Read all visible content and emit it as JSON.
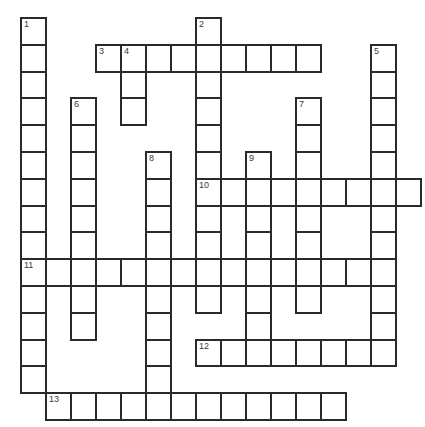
{
  "puzzle": {
    "title": "Crossword Grid",
    "grid": {
      "columns": 16,
      "rows": 15,
      "cell_width": 25,
      "cell_height": 26.8,
      "origin_x": 20,
      "origin_y": 17,
      "border_color": "#2a2a2a",
      "cell_fill": "#ffffff",
      "number_color": "#3a3a3a",
      "background": "#ffffff"
    },
    "entries": [
      {
        "number": "1",
        "direction": "down",
        "row": 0,
        "col": 0,
        "length": 14
      },
      {
        "number": "2",
        "direction": "down",
        "row": 0,
        "col": 7,
        "length": 11
      },
      {
        "number": "3",
        "direction": "across",
        "row": 1,
        "col": 3,
        "length": 9
      },
      {
        "number": "4",
        "direction": "down",
        "row": 1,
        "col": 4,
        "length": 3
      },
      {
        "number": "5",
        "direction": "down",
        "row": 1,
        "col": 14,
        "length": 12
      },
      {
        "number": "6",
        "direction": "down",
        "row": 3,
        "col": 2,
        "length": 9
      },
      {
        "number": "7",
        "direction": "down",
        "row": 3,
        "col": 11,
        "length": 8
      },
      {
        "number": "8",
        "direction": "down",
        "row": 5,
        "col": 5,
        "length": 10
      },
      {
        "number": "9",
        "direction": "down",
        "row": 5,
        "col": 9,
        "length": 8
      },
      {
        "number": "10",
        "direction": "across",
        "row": 6,
        "col": 7,
        "length": 9
      },
      {
        "number": "11",
        "direction": "across",
        "row": 9,
        "col": 0,
        "length": 14
      },
      {
        "number": "12",
        "direction": "across",
        "row": 12,
        "col": 7,
        "length": 8
      },
      {
        "number": "13",
        "direction": "across",
        "row": 14,
        "col": 1,
        "length": 12
      }
    ],
    "numbered_cells": [
      {
        "label": "1",
        "row": 0,
        "col": 0
      },
      {
        "label": "2",
        "row": 0,
        "col": 7
      },
      {
        "label": "3",
        "row": 1,
        "col": 3
      },
      {
        "label": "4",
        "row": 1,
        "col": 4
      },
      {
        "label": "5",
        "row": 1,
        "col": 14
      },
      {
        "label": "6",
        "row": 3,
        "col": 2
      },
      {
        "label": "7",
        "row": 3,
        "col": 11
      },
      {
        "label": "8",
        "row": 5,
        "col": 5
      },
      {
        "label": "9",
        "row": 5,
        "col": 9
      },
      {
        "label": "10",
        "row": 6,
        "col": 7
      },
      {
        "label": "11",
        "row": 9,
        "col": 0
      },
      {
        "label": "12",
        "row": 12,
        "col": 7
      },
      {
        "label": "13",
        "row": 14,
        "col": 1
      }
    ],
    "letters": []
  }
}
